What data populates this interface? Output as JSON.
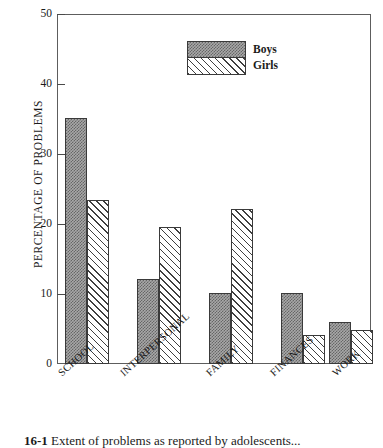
{
  "chart_data": {
    "type": "bar",
    "title": "",
    "xlabel": "",
    "ylabel": "PERCENTAGE OF PROBLEMS",
    "ylim": [
      0,
      50
    ],
    "yticks": [
      0,
      10,
      20,
      30,
      40,
      50
    ],
    "grid": false,
    "legend_position": "top-center",
    "categories": [
      "SCHOOL",
      "INTERPERSONAL",
      "FAMILY",
      "FINANCES",
      "WORK"
    ],
    "series": [
      {
        "name": "Boys",
        "values": [
          35.1,
          12.1,
          10.2,
          10.2,
          6.0
        ]
      },
      {
        "name": "Girls",
        "values": [
          23.4,
          19.6,
          22.2,
          4.2,
          4.9
        ]
      }
    ]
  },
  "axis": {
    "y_title": "PERCENTAGE OF PROBLEMS",
    "tick_labels": [
      "50",
      "40",
      "30",
      "20",
      "10",
      "0"
    ]
  },
  "legend": {
    "entries": [
      {
        "label": "Boys",
        "pattern": "gray-checker"
      },
      {
        "label": "Girls",
        "pattern": "diagonal-hatch"
      }
    ]
  },
  "caption": {
    "number": "16-1",
    "text": "Extent of problems as reported by adolescents..."
  }
}
